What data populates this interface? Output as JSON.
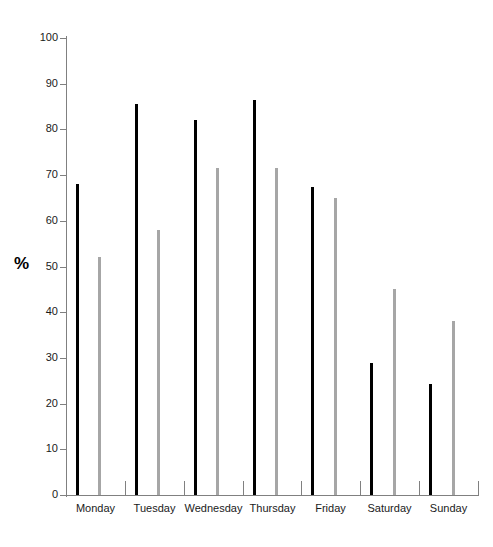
{
  "chart_data": {
    "type": "bar",
    "title": "",
    "subtitle": "",
    "xlabel": "",
    "ylabel": "%",
    "ylim": [
      0,
      100
    ],
    "ytick_step": 10,
    "yticks": [
      0,
      10,
      20,
      30,
      40,
      50,
      60,
      70,
      80,
      90,
      100
    ],
    "ytick_labels": [
      "0",
      "10",
      "20",
      "30",
      "40",
      "50",
      "60",
      "70",
      "80",
      "90",
      "100"
    ],
    "grid": false,
    "legend": "none",
    "categories": [
      "Monday",
      "Tuesday",
      "Wednesday",
      "Thursday",
      "Friday",
      "Saturday",
      "Sunday"
    ],
    "series": [
      {
        "name": "series-1",
        "color": "#000000",
        "values": [
          68,
          85.5,
          82,
          86.5,
          67.5,
          28.8,
          24.3
        ]
      },
      {
        "name": "series-2",
        "color": "#a6a6a6",
        "values": [
          52,
          58,
          71.5,
          71.5,
          65,
          45,
          38
        ]
      }
    ]
  },
  "axes": {
    "y_title": "%",
    "axis_color": "#808080",
    "tick_color": "#808080",
    "label_color": "#1a1a1a"
  }
}
